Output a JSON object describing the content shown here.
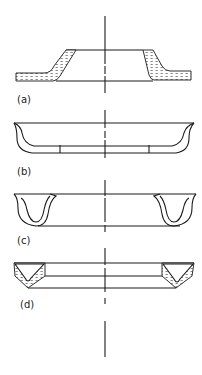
{
  "figure": {
    "centerline_x": 105,
    "panels": [
      {
        "id": "a",
        "label": "(a)",
        "shape": "tapered conical flange with hatched wall"
      },
      {
        "id": "b",
        "label": "(b)",
        "shape": "shallow dish with curved rim"
      },
      {
        "id": "c",
        "label": "(c)",
        "shape": "ring with U-shaped lip profiles"
      },
      {
        "id": "d",
        "label": "(d)",
        "shape": "ring with hatched V-groove profiles"
      }
    ]
  }
}
